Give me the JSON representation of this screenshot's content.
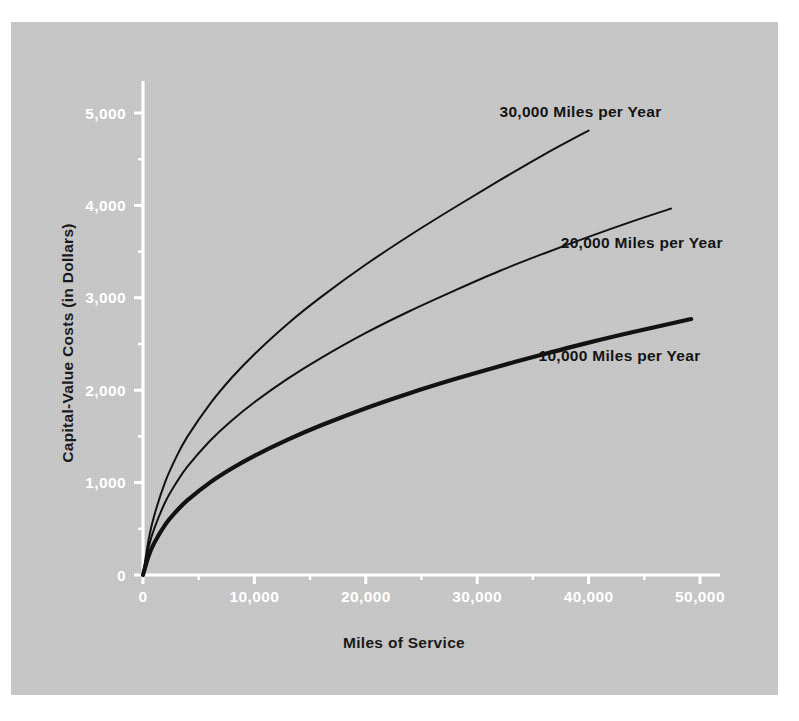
{
  "figure": {
    "background_color": "#ffffff",
    "panel_color": "#c6c6c6",
    "axis_color": "#ffffff",
    "curve_color": "#121212",
    "text_color": "#141414"
  },
  "chart_data": {
    "type": "line",
    "title": "",
    "xlabel": "Miles of Service",
    "ylabel": "Capital-Value Costs (in Dollars)",
    "xlim": [
      0,
      52000
    ],
    "ylim": [
      0,
      5500
    ],
    "xticks": [
      0,
      10000,
      20000,
      30000,
      40000,
      50000
    ],
    "xticklabels": [
      "0",
      "10,000",
      "20,000",
      "30,000",
      "40,000",
      "50,000"
    ],
    "yticks": [
      0,
      1000,
      2000,
      3000,
      4000,
      5000
    ],
    "yticklabels": [
      "0",
      "1,000",
      "2,000",
      "3,000",
      "4,000",
      "5,000"
    ],
    "x_minor_ticks": [
      5000,
      15000,
      25000,
      35000,
      45000
    ],
    "y_minor_ticks": [
      500,
      1500,
      2500,
      3500,
      4500
    ],
    "grid": false,
    "legend_position": "inline-labels",
    "series": [
      {
        "name": "30,000 Miles per Year",
        "label": "30,000 Miles per Year",
        "line_width": 2.0,
        "label_x": 32000,
        "label_y": 4960,
        "x": [
          0,
          500,
          1000,
          2000,
          3000,
          4000,
          6000,
          8000,
          10000,
          13000,
          16000,
          20000,
          24000,
          28000,
          32000,
          36000,
          40000
        ],
        "y": [
          0,
          380,
          640,
          1010,
          1280,
          1500,
          1850,
          2140,
          2390,
          2720,
          3010,
          3360,
          3680,
          3980,
          4270,
          4550,
          4810
        ]
      },
      {
        "name": "20,000 Miles per Year",
        "label": "20,000 Miles per Year",
        "line_width": 2.0,
        "label_x": 37500,
        "label_y": 3540,
        "x": [
          0,
          500,
          1000,
          2000,
          3000,
          4000,
          6000,
          8000,
          10000,
          13000,
          16000,
          20000,
          24000,
          28000,
          32000,
          36000,
          40000,
          44000,
          47400
        ],
        "y": [
          0,
          300,
          500,
          790,
          1000,
          1175,
          1450,
          1675,
          1870,
          2125,
          2350,
          2620,
          2860,
          3080,
          3290,
          3480,
          3660,
          3830,
          3965
        ]
      },
      {
        "name": "10,000 Miles per Year",
        "label": "10,000 Miles per Year",
        "line_width": 4.2,
        "label_x": 35500,
        "label_y": 2320,
        "x": [
          0,
          500,
          1000,
          2000,
          3000,
          4000,
          6000,
          8000,
          10000,
          13000,
          16000,
          20000,
          24000,
          28000,
          32000,
          36000,
          40000,
          44000,
          49200
        ],
        "y": [
          0,
          205,
          345,
          545,
          690,
          810,
          1000,
          1155,
          1290,
          1465,
          1620,
          1805,
          1970,
          2120,
          2260,
          2390,
          2515,
          2630,
          2770
        ]
      }
    ]
  }
}
